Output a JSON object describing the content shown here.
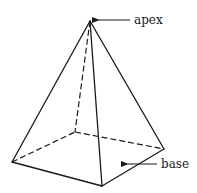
{
  "diagram": {
    "type": "square pyramid",
    "labels": {
      "apex": "apex",
      "base": "base"
    },
    "vertices": {
      "apex": [
        90,
        21
      ],
      "left": [
        12,
        162
      ],
      "back": [
        75,
        132
      ],
      "front": [
        102,
        186
      ],
      "right": [
        164,
        149
      ]
    },
    "colors": {
      "line": "#1a1a1a",
      "background": "#ffffff"
    }
  }
}
